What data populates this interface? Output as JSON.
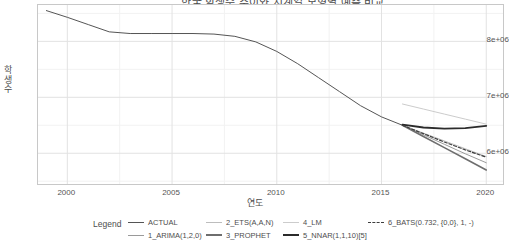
{
  "chart_title": "한국 학생수 추이와 시계열 모형별 예측 비교",
  "legend": {
    "title": "Legend",
    "items": [
      {
        "label": "ACTUAL",
        "style": "solid",
        "weight": "normal",
        "color": "#555555"
      },
      {
        "label": "1_ARIMA(1,2,0)",
        "style": "solid",
        "weight": "normal",
        "color": "#9a9a9a"
      },
      {
        "label": "2_ETS(A,A,N)",
        "style": "solid",
        "weight": "normal",
        "color": "#bdbdbd"
      },
      {
        "label": "3_PROPHET",
        "style": "solid",
        "weight": "thick",
        "color": "#6e6e6e"
      },
      {
        "label": "4_LM",
        "style": "solid",
        "weight": "normal",
        "color": "#cccccc"
      },
      {
        "label": "5_NNAR(1,1,10)[5]",
        "style": "solid",
        "weight": "thick",
        "color": "#2b2b2b"
      },
      {
        "label": "6_BATS(0.732, {0,0}, 1, -)",
        "style": "dashed",
        "weight": "normal",
        "color": "#3d3d3d"
      }
    ]
  },
  "chart_data": {
    "type": "line",
    "title": "한국 학생수 추이와 시계열 모형별 예측 비교",
    "xlabel": "연도",
    "ylabel": "학생수",
    "xlim": [
      1998.6,
      2020.8
    ],
    "ylim": [
      5450000,
      8650000
    ],
    "xticks": [
      2000,
      2005,
      2010,
      2015,
      2020
    ],
    "xticklabels": [
      "2000",
      "2005",
      "2010",
      "2015",
      "2020"
    ],
    "yticks": [
      6000000,
      7000000,
      8000000
    ],
    "yticklabels": [
      "6e+06",
      "7e+06",
      "8e+06"
    ],
    "minor_yticks": [
      5500000,
      6500000,
      7500000,
      8500000
    ],
    "minor_xticks": [
      2002.5,
      2007.5,
      2012.5,
      2017.5
    ],
    "grid": true,
    "legend_position": "bottom",
    "series": [
      {
        "name": "ACTUAL",
        "color": "#555555",
        "style": "solid",
        "width": 1.0,
        "x": [
          1999,
          2000,
          2001,
          2002,
          2003,
          2004,
          2005,
          2006,
          2007,
          2008,
          2009,
          2010,
          2011,
          2012,
          2013,
          2014,
          2015,
          2016
        ],
        "y": [
          8550000,
          8430000,
          8300000,
          8170000,
          8140000,
          8140000,
          8140000,
          8140000,
          8130000,
          8090000,
          7990000,
          7820000,
          7600000,
          7350000,
          7100000,
          6850000,
          6650000,
          6500000
        ]
      },
      {
        "name": "1_ARIMA(1,2,0)",
        "color": "#9a9a9a",
        "style": "solid",
        "width": 1.0,
        "x": [
          2016,
          2017,
          2018,
          2019,
          2020
        ],
        "y": [
          6500000,
          6330000,
          6160000,
          5990000,
          5830000
        ]
      },
      {
        "name": "2_ETS(A,A,N)",
        "color": "#bdbdbd",
        "style": "solid",
        "width": 1.0,
        "x": [
          2016,
          2017,
          2018,
          2019,
          2020
        ],
        "y": [
          6500000,
          6360000,
          6220000,
          6080000,
          5940000
        ]
      },
      {
        "name": "3_PROPHET",
        "color": "#6e6e6e",
        "style": "solid",
        "width": 1.6,
        "x": [
          2016,
          2017,
          2018,
          2019,
          2020
        ],
        "y": [
          6500000,
          6300000,
          6100000,
          5900000,
          5700000
        ]
      },
      {
        "name": "4_LM",
        "color": "#cccccc",
        "style": "solid",
        "width": 1.0,
        "x": [
          2016,
          2017,
          2018,
          2019,
          2020
        ],
        "y": [
          6880000,
          6790000,
          6700000,
          6610000,
          6520000
        ]
      },
      {
        "name": "5_NNAR(1,1,10)[5]",
        "color": "#2b2b2b",
        "style": "solid",
        "width": 1.8,
        "x": [
          2016,
          2017,
          2018,
          2019,
          2020
        ],
        "y": [
          6510000,
          6460000,
          6440000,
          6450000,
          6490000
        ]
      },
      {
        "name": "6_BATS(0.732, {0,0}, 1, -)",
        "color": "#3d3d3d",
        "style": "dashed",
        "width": 1.2,
        "x": [
          2016,
          2017,
          2018,
          2019,
          2020
        ],
        "y": [
          6500000,
          6350000,
          6200000,
          6060000,
          5930000
        ]
      }
    ]
  }
}
